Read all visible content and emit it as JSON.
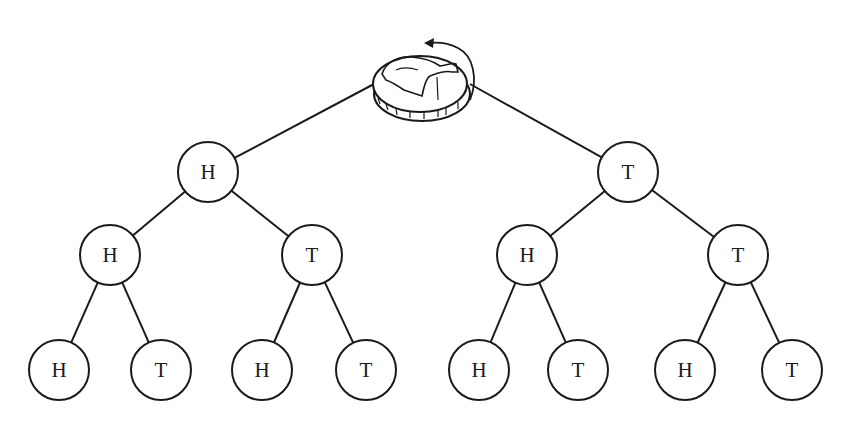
{
  "diagram": {
    "root": {
      "icon": "coin-flip-icon",
      "x": 422,
      "y": 88
    },
    "nodes": [
      {
        "id": "n1",
        "label": "H",
        "x": 208,
        "y": 172,
        "parent": "root"
      },
      {
        "id": "n2",
        "label": "T",
        "x": 628,
        "y": 172,
        "parent": "root"
      },
      {
        "id": "n3",
        "label": "H",
        "x": 110,
        "y": 255,
        "parent": "n1"
      },
      {
        "id": "n4",
        "label": "T",
        "x": 312,
        "y": 255,
        "parent": "n1"
      },
      {
        "id": "n5",
        "label": "H",
        "x": 527,
        "y": 255,
        "parent": "n2"
      },
      {
        "id": "n6",
        "label": "T",
        "x": 738,
        "y": 255,
        "parent": "n2"
      },
      {
        "id": "n7",
        "label": "H",
        "x": 59,
        "y": 370,
        "parent": "n3"
      },
      {
        "id": "n8",
        "label": "T",
        "x": 161,
        "y": 370,
        "parent": "n3"
      },
      {
        "id": "n9",
        "label": "H",
        "x": 262,
        "y": 370,
        "parent": "n4"
      },
      {
        "id": "n10",
        "label": "T",
        "x": 366,
        "y": 370,
        "parent": "n4"
      },
      {
        "id": "n11",
        "label": "H",
        "x": 479,
        "y": 370,
        "parent": "n5"
      },
      {
        "id": "n12",
        "label": "T",
        "x": 578,
        "y": 370,
        "parent": "n5"
      },
      {
        "id": "n13",
        "label": "H",
        "x": 685,
        "y": 370,
        "parent": "n6"
      },
      {
        "id": "n14",
        "label": "T",
        "x": 792,
        "y": 370,
        "parent": "n6"
      }
    ],
    "node_radius": 30,
    "stroke_color": "#1a1a1a"
  }
}
